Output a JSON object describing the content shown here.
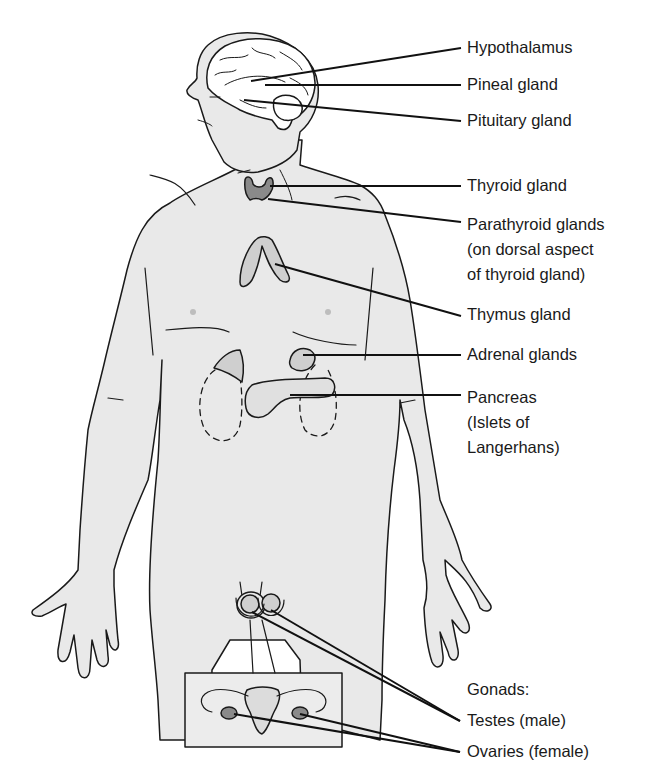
{
  "diagram": {
    "type": "anatomical-labeled-figure",
    "colors": {
      "body_fill": "#e9e9e9",
      "outline": "#1a1a1a",
      "gland_fill": "#cfcfcf",
      "background": "#ffffff"
    }
  },
  "labels": {
    "hypothalamus": {
      "lines": [
        "Hypothalamus"
      ]
    },
    "pineal": {
      "lines": [
        "Pineal gland"
      ]
    },
    "pituitary": {
      "lines": [
        "Pituitary gland"
      ]
    },
    "thyroid": {
      "lines": [
        "Thyroid gland"
      ]
    },
    "parathyroid": {
      "lines": [
        "Parathyroid glands",
        "(on dorsal aspect",
        "of thyroid gland)"
      ]
    },
    "thymus": {
      "lines": [
        "Thymus gland"
      ]
    },
    "adrenal": {
      "lines": [
        "Adrenal glands"
      ]
    },
    "pancreas": {
      "lines": [
        "Pancreas",
        "(Islets of",
        "Langerhans)"
      ]
    },
    "gonads": {
      "lines": [
        "Gonads:"
      ]
    },
    "testes": {
      "lines": [
        "Testes (male)"
      ]
    },
    "ovaries": {
      "lines": [
        "Ovaries (female)"
      ]
    }
  }
}
